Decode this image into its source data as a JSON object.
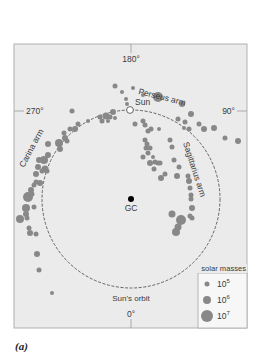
{
  "figure": {
    "caption": "(a)",
    "frame": {
      "x": 14,
      "y": 44,
      "w": 233,
      "h": 284,
      "fill": "#ebebeb",
      "stroke": "#a8a8a8"
    },
    "galactic_center": {
      "label": "GC",
      "x": 131,
      "y": 199,
      "color": "#000000"
    },
    "sun": {
      "label": "Sun",
      "x": 130,
      "y": 110
    },
    "orbit": {
      "label": "Sun's orbit",
      "cx": 131,
      "cy": 199,
      "r": 89,
      "color": "#555555"
    },
    "longitude_ticks": [
      {
        "label": "180°",
        "x": 131,
        "y": 62,
        "anchor": "middle"
      },
      {
        "label": "270°",
        "x": 26,
        "y": 114,
        "anchor": "start"
      },
      {
        "label": "90°",
        "x": 235,
        "y": 114,
        "anchor": "end"
      },
      {
        "label": "0°",
        "x": 131,
        "y": 317,
        "anchor": "middle"
      }
    ],
    "arm_labels": [
      {
        "label": "Perseus arm",
        "x": 138,
        "y": 94,
        "rotate": 14
      },
      {
        "label": "Carina arm",
        "x": 24,
        "y": 168,
        "rotate": -62
      },
      {
        "label": "Sagittarius arm",
        "x": 183,
        "y": 143,
        "rotate": 72
      }
    ],
    "legend": {
      "title": "solar masses",
      "items": [
        {
          "label": "10",
          "exp": "5",
          "r": 2.5
        },
        {
          "label": "10",
          "exp": "6",
          "r": 4
        },
        {
          "label": "10",
          "exp": "7",
          "r": 6
        }
      ]
    },
    "cloud_color": "#888888",
    "clouds": [
      [
        115,
        86,
        2.5
      ],
      [
        122,
        92,
        2
      ],
      [
        133,
        88,
        2
      ],
      [
        143,
        95,
        2
      ],
      [
        158,
        97,
        5
      ],
      [
        182,
        104,
        3
      ],
      [
        126,
        99,
        2
      ],
      [
        127,
        104,
        2
      ],
      [
        72,
        111,
        2.5
      ],
      [
        191,
        114,
        3
      ],
      [
        185,
        122,
        2.5
      ],
      [
        178,
        119,
        2.5
      ],
      [
        184,
        128,
        2
      ],
      [
        189,
        129,
        2.5
      ],
      [
        199,
        124,
        2.5
      ],
      [
        204,
        129,
        3
      ],
      [
        214,
        128,
        3
      ],
      [
        225,
        138,
        2.5
      ],
      [
        238,
        141,
        3
      ],
      [
        113,
        112,
        3
      ],
      [
        106,
        116,
        3.5
      ],
      [
        110,
        117,
        2.5
      ],
      [
        100,
        117,
        2.5
      ],
      [
        102,
        121,
        2.5
      ],
      [
        108,
        121,
        2
      ],
      [
        115,
        118,
        2
      ],
      [
        88,
        121,
        2
      ],
      [
        78,
        124,
        2.5
      ],
      [
        75,
        129,
        3
      ],
      [
        70,
        129,
        2.5
      ],
      [
        65,
        138,
        3
      ],
      [
        64,
        133,
        2.5
      ],
      [
        59,
        143,
        4
      ],
      [
        60,
        149,
        3
      ],
      [
        67,
        141,
        2.5
      ],
      [
        48,
        144,
        3
      ],
      [
        48,
        155,
        3
      ],
      [
        44,
        160,
        4
      ],
      [
        39,
        160,
        3
      ],
      [
        38,
        167,
        3
      ],
      [
        45,
        169,
        3.5
      ],
      [
        42,
        171,
        2.5
      ],
      [
        47,
        171,
        2.5
      ],
      [
        36,
        174,
        3
      ],
      [
        40,
        183,
        3
      ],
      [
        36,
        182,
        2.5
      ],
      [
        34,
        185,
        2.5
      ],
      [
        31,
        190,
        3
      ],
      [
        28,
        197,
        5
      ],
      [
        32,
        194,
        2.5
      ],
      [
        34,
        207,
        2.5
      ],
      [
        26,
        208,
        4
      ],
      [
        26,
        214,
        3
      ],
      [
        27,
        218,
        2.5
      ],
      [
        20,
        219,
        4
      ],
      [
        29,
        228,
        2.5
      ],
      [
        30,
        233,
        3
      ],
      [
        36,
        234,
        2.5
      ],
      [
        37,
        254,
        3
      ],
      [
        39,
        270,
        2.5
      ],
      [
        52,
        293,
        2
      ],
      [
        135,
        124,
        2.5
      ],
      [
        143,
        121,
        2.5
      ],
      [
        145,
        125,
        2.5
      ],
      [
        148,
        131,
        2.5
      ],
      [
        151,
        129,
        2.5
      ],
      [
        159,
        129,
        2
      ],
      [
        145,
        140,
        2.5
      ],
      [
        147,
        144,
        2.5
      ],
      [
        146,
        148,
        2.5
      ],
      [
        150,
        148,
        2.5
      ],
      [
        148,
        153,
        2.5
      ],
      [
        143,
        157,
        2.5
      ],
      [
        150,
        163,
        3
      ],
      [
        153,
        157,
        2
      ],
      [
        155,
        162,
        2.5
      ],
      [
        158,
        163,
        2.5
      ],
      [
        170,
        140,
        2.5
      ],
      [
        172,
        147,
        2.5
      ],
      [
        154,
        169,
        2.5
      ],
      [
        160,
        163,
        2.5
      ],
      [
        165,
        174,
        2.5
      ],
      [
        161,
        178,
        3
      ],
      [
        174,
        160,
        2.5
      ],
      [
        179,
        167,
        2.5
      ],
      [
        177,
        176,
        3
      ],
      [
        188,
        176,
        2.5
      ],
      [
        189,
        181,
        3
      ],
      [
        190,
        188,
        2.5
      ],
      [
        191,
        195,
        2.5
      ],
      [
        191,
        199,
        2.5
      ],
      [
        192,
        208,
        3
      ],
      [
        192,
        218,
        2.5
      ],
      [
        172,
        214,
        3.5
      ],
      [
        181,
        220,
        5
      ],
      [
        190,
        216,
        2.5
      ],
      [
        178,
        227,
        3.5
      ],
      [
        176,
        232,
        4
      ]
    ]
  }
}
